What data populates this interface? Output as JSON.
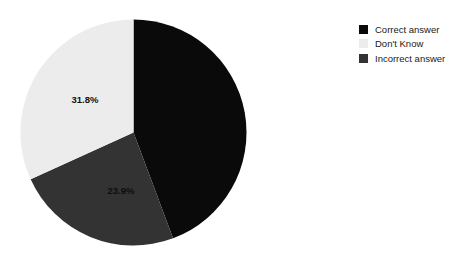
{
  "chart": {
    "type": "pie",
    "title": "",
    "background_color": "#ffffff"
  },
  "chart_data": {
    "type": "pie",
    "title": "",
    "subtitle": "",
    "xlabel": "",
    "ylabel": "",
    "grid": false,
    "legend_position": "top-right",
    "labels": [
      "Correct answer",
      "Don't Know",
      "Incorrect answer"
    ],
    "values": [
      44.3,
      31.8,
      23.9
    ],
    "value_unit": "%",
    "colors": [
      "#0a0a0a",
      "#ececec",
      "#333333"
    ],
    "visible_data_labels": [
      "",
      "31.8%",
      "23.9%"
    ],
    "start_angle_deg": 0,
    "direction": "clockwise",
    "slices": [
      {
        "label": "Correct answer",
        "value": 44.3,
        "display": "44.3%",
        "color": "#0a0a0a",
        "label_visible": false,
        "start_deg": 0,
        "end_deg": 159.5
      },
      {
        "label": "Incorrect answer",
        "value": 23.9,
        "display": "23.9%",
        "color": "#333333",
        "label_visible": true,
        "start_deg": 159.5,
        "end_deg": 245.5
      },
      {
        "label": "Don't Know",
        "value": 31.8,
        "display": "31.8%",
        "color": "#ececec",
        "label_visible": true,
        "start_deg": 245.5,
        "end_deg": 360
      }
    ]
  },
  "legend": {
    "items": [
      {
        "label": "Correct answer",
        "color": "#0a0a0a"
      },
      {
        "label": "Don't Know",
        "color": "#ececec"
      },
      {
        "label": "Incorrect answer",
        "color": "#333333"
      }
    ]
  },
  "data_labels": {
    "light_slice": "31.8%",
    "gray_slice": "23.9%"
  }
}
